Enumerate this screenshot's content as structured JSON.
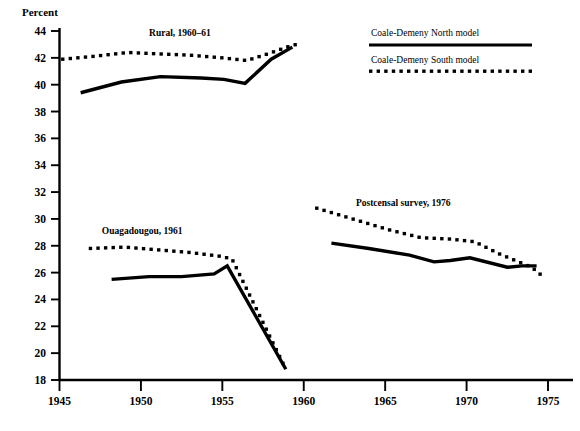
{
  "chart_data": {
    "type": "line",
    "title": "",
    "subtitle": "",
    "xlabel": "",
    "ylabel": "Percent",
    "xlim": [
      1945,
      1976
    ],
    "ylim": [
      18,
      44
    ],
    "xticks": [
      1945,
      1950,
      1955,
      1960,
      1965,
      1970,
      1975
    ],
    "yticks": [
      18,
      20,
      22,
      24,
      26,
      28,
      30,
      32,
      34,
      36,
      38,
      40,
      42,
      44
    ],
    "grid": false,
    "legend_position": "top-right",
    "legend": [
      {
        "name": "Coale-Demeny North model",
        "style": "solid"
      },
      {
        "name": "Coale-Demeny South model",
        "style": "dotted"
      }
    ],
    "annotations": [
      {
        "text": "Rural, 1960–61",
        "x": 1950.5,
        "y": 43.6
      },
      {
        "text": "Ouagadougou, 1961",
        "x": 1947.6,
        "y": 28.9
      },
      {
        "text": "Postcensal survey, 1976",
        "x": 1963.2,
        "y": 31.0
      }
    ],
    "groups": [
      {
        "name": "Rural, 1960-61",
        "series": [
          {
            "name": "Coale-Demeny North model",
            "style": "solid",
            "x": [
              1946.3,
              1948.8,
              1951.2,
              1953.7,
              1955.1,
              1956.4,
              1958.0,
              1959.3
            ],
            "y": [
              39.4,
              40.2,
              40.6,
              40.5,
              40.4,
              40.1,
              41.9,
              42.8
            ]
          },
          {
            "name": "Coale-Demeny South model",
            "style": "dotted",
            "x": [
              1945.2,
              1947.0,
              1949.2,
              1951.0,
              1953.0,
              1955.0,
              1956.5,
              1957.8,
              1959.2,
              1959.9
            ],
            "y": [
              41.9,
              42.1,
              42.4,
              42.3,
              42.2,
              42.0,
              41.8,
              42.3,
              42.9,
              43.1
            ]
          }
        ]
      },
      {
        "name": "Ouagadougou, 1961",
        "series": [
          {
            "name": "Coale-Demeny North model",
            "style": "solid",
            "x": [
              1948.2,
              1950.5,
              1952.5,
              1954.5,
              1955.3,
              1958.9
            ],
            "y": [
              25.5,
              25.7,
              25.7,
              25.9,
              26.5,
              18.8
            ]
          },
          {
            "name": "Coale-Demeny South model",
            "style": "dotted",
            "x": [
              1946.9,
              1949.0,
              1951.0,
              1953.0,
              1955.0,
              1955.6,
              1958.9
            ],
            "y": [
              27.8,
              27.9,
              27.7,
              27.5,
              27.2,
              27.0,
              18.8
            ]
          }
        ]
      },
      {
        "name": "Postcensal survey, 1976",
        "series": [
          {
            "name": "Coale-Demeny North model",
            "style": "solid",
            "x": [
              1961.7,
              1964.0,
              1966.5,
              1968.0,
              1969.0,
              1970.2,
              1972.5,
              1973.4,
              1974.3
            ],
            "y": [
              28.2,
              27.8,
              27.3,
              26.8,
              26.9,
              27.1,
              26.4,
              26.5,
              26.5
            ]
          },
          {
            "name": "Coale-Demeny South model",
            "style": "dotted",
            "x": [
              1960.8,
              1963.0,
              1965.2,
              1967.2,
              1969.0,
              1970.5,
              1972.0,
              1973.0,
              1974.0,
              1974.6
            ],
            "y": [
              30.8,
              30.0,
              29.2,
              28.6,
              28.5,
              28.3,
              27.4,
              26.9,
              26.4,
              25.8
            ]
          }
        ]
      }
    ]
  },
  "axis": {
    "y_title": "Percent",
    "y_tick_labels": [
      "44",
      "42",
      "40",
      "38",
      "36",
      "34",
      "32",
      "30",
      "28",
      "26",
      "24",
      "22",
      "20",
      "18"
    ],
    "x_tick_labels": [
      "1945",
      "1950",
      "1955",
      "1960",
      "1965",
      "1970",
      "1975"
    ]
  },
  "annotations": {
    "rural": "Rural, 1960–61",
    "ouagadougou": "Ouagadougou, 1961",
    "postcensal": "Postcensal survey, 1976"
  },
  "legend": {
    "north_label": "Coale-Demeny North model",
    "south_label": "Coale-Demeny South model"
  },
  "colors": {
    "ink": "#000000",
    "background": "#ffffff"
  }
}
